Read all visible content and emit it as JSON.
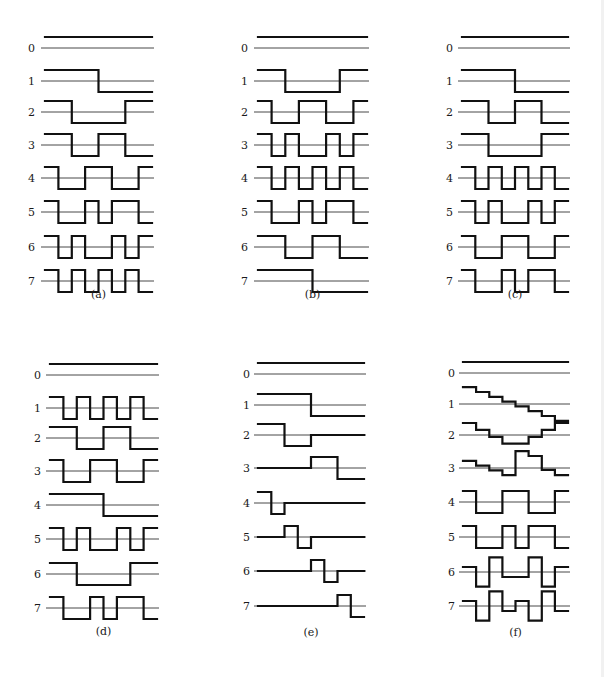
{
  "figure": {
    "row_labels": [
      "0",
      "1",
      "2",
      "3",
      "4",
      "5",
      "6",
      "7"
    ],
    "panels": [
      {
        "id": "a",
        "caption": "(a)",
        "x0": 45,
        "x1": 152,
        "label_x": 28,
        "axis_y": [
          48,
          81,
          112,
          145,
          178,
          212,
          247,
          281
        ],
        "amp": 11,
        "caption_y": 298,
        "rows": [
          [
            1,
            1,
            1,
            1,
            1,
            1,
            1,
            1
          ],
          [
            1,
            1,
            1,
            1,
            -1,
            -1,
            -1,
            -1
          ],
          [
            1,
            1,
            -1,
            -1,
            -1,
            -1,
            1,
            1
          ],
          [
            1,
            1,
            -1,
            -1,
            1,
            1,
            -1,
            -1
          ],
          [
            1,
            -1,
            -1,
            1,
            1,
            -1,
            -1,
            1
          ],
          [
            1,
            -1,
            -1,
            1,
            -1,
            1,
            1,
            -1
          ],
          [
            1,
            -1,
            1,
            -1,
            -1,
            1,
            -1,
            1
          ],
          [
            1,
            -1,
            1,
            -1,
            1,
            -1,
            1,
            -1
          ]
        ]
      },
      {
        "id": "b",
        "caption": "(b)",
        "x0": 258,
        "x1": 367,
        "label_x": 241,
        "axis_y": [
          48,
          81,
          112,
          145,
          178,
          212,
          247,
          281
        ],
        "amp": 11,
        "caption_y": 298,
        "rows": [
          [
            1,
            1,
            1,
            1,
            1,
            1,
            1,
            1
          ],
          [
            1,
            1,
            -1,
            -1,
            -1,
            -1,
            1,
            1
          ],
          [
            1,
            -1,
            -1,
            1,
            1,
            -1,
            -1,
            1
          ],
          [
            1,
            -1,
            1,
            -1,
            -1,
            1,
            -1,
            1
          ],
          [
            1,
            -1,
            1,
            -1,
            1,
            -1,
            1,
            -1
          ],
          [
            1,
            -1,
            -1,
            1,
            -1,
            1,
            1,
            -1
          ],
          [
            1,
            1,
            -1,
            -1,
            1,
            1,
            -1,
            -1
          ],
          [
            1,
            1,
            1,
            1,
            -1,
            -1,
            -1,
            -1
          ]
        ]
      },
      {
        "id": "c",
        "caption": "(c)",
        "x0": 462,
        "x1": 568,
        "label_x": 446,
        "axis_y": [
          48,
          81,
          112,
          145,
          178,
          212,
          247,
          281
        ],
        "amp": 11,
        "caption_y": 298,
        "rows": [
          [
            1,
            1,
            1,
            1,
            1,
            1,
            1,
            1
          ],
          [
            1,
            1,
            1,
            1,
            -1,
            -1,
            -1,
            -1
          ],
          [
            1,
            1,
            -1,
            -1,
            1,
            1,
            -1,
            -1
          ],
          [
            1,
            1,
            -1,
            -1,
            -1,
            -1,
            1,
            1
          ],
          [
            1,
            -1,
            1,
            -1,
            1,
            -1,
            1,
            -1
          ],
          [
            1,
            -1,
            1,
            -1,
            -1,
            1,
            -1,
            1
          ],
          [
            1,
            -1,
            -1,
            1,
            1,
            -1,
            -1,
            1
          ],
          [
            1,
            -1,
            -1,
            1,
            -1,
            1,
            1,
            -1
          ]
        ]
      },
      {
        "id": "d",
        "caption": "(d)",
        "x0": 50,
        "x1": 157,
        "label_x": 34,
        "axis_y": [
          375,
          408,
          438,
          471,
          505,
          539,
          574,
          608
        ],
        "amp": 11,
        "caption_y": 635,
        "rows": [
          [
            1,
            1,
            1,
            1,
            1,
            1,
            1,
            1
          ],
          [
            1,
            -1,
            1,
            -1,
            1,
            -1,
            1,
            -1
          ],
          [
            1,
            1,
            -1,
            -1,
            1,
            1,
            -1,
            -1
          ],
          [
            1,
            -1,
            -1,
            1,
            1,
            -1,
            -1,
            1
          ],
          [
            1,
            1,
            1,
            1,
            -1,
            -1,
            -1,
            -1
          ],
          [
            1,
            -1,
            1,
            -1,
            -1,
            1,
            -1,
            1
          ],
          [
            1,
            1,
            -1,
            -1,
            -1,
            -1,
            1,
            1
          ],
          [
            1,
            -1,
            -1,
            1,
            -1,
            1,
            1,
            -1
          ]
        ]
      },
      {
        "id": "e",
        "caption": "(e)",
        "x0": 258,
        "x1": 364,
        "label_x": 243,
        "axis_y": [
          374,
          405,
          435,
          468,
          503,
          537,
          571,
          606
        ],
        "amp": 11,
        "caption_y": 636,
        "rows": [
          [
            1,
            1,
            1,
            1,
            1,
            1,
            1,
            1
          ],
          [
            1,
            1,
            1,
            1,
            -1,
            -1,
            -1,
            -1
          ],
          [
            1,
            1,
            -1,
            -1,
            0,
            0,
            0,
            0
          ],
          [
            0,
            0,
            0,
            0,
            1,
            1,
            -1,
            -1
          ],
          [
            1,
            -1,
            0,
            0,
            0,
            0,
            0,
            0
          ],
          [
            0,
            0,
            1,
            -1,
            0,
            0,
            0,
            0
          ],
          [
            0,
            0,
            0,
            0,
            1,
            -1,
            0,
            0
          ],
          [
            0,
            0,
            0,
            0,
            0,
            0,
            1,
            -1
          ]
        ]
      },
      {
        "id": "f",
        "caption": "(f)",
        "x0": 463,
        "x1": 568,
        "label_x": 448,
        "axis_y": [
          373,
          404,
          435,
          468,
          502,
          537,
          572,
          606
        ],
        "amp": 11,
        "caption_y": 636,
        "rows": [
          [
            1,
            1,
            1,
            1,
            1,
            1,
            1,
            1
          ],
          [
            1.53,
            1.09,
            0.65,
            0.22,
            -0.22,
            -0.65,
            -1.09,
            -1.53
          ],
          [
            1.09,
            0.47,
            -0.16,
            -0.78,
            -0.78,
            -0.16,
            0.47,
            1.09
          ],
          [
            0.65,
            0.22,
            -0.22,
            -0.65,
            1.53,
            1.09,
            -0.16,
            -0.65
          ],
          [
            1,
            -1,
            -1,
            1,
            1,
            -1,
            -1,
            1
          ],
          [
            1,
            -1,
            -1,
            1,
            -1,
            1,
            1,
            -1
          ],
          [
            0.45,
            -1.34,
            1.34,
            -0.45,
            -0.45,
            1.34,
            -1.34,
            0.45
          ],
          [
            0.45,
            -1.34,
            1.34,
            -0.45,
            0.45,
            -1.34,
            1.34,
            -0.45
          ]
        ]
      }
    ]
  }
}
